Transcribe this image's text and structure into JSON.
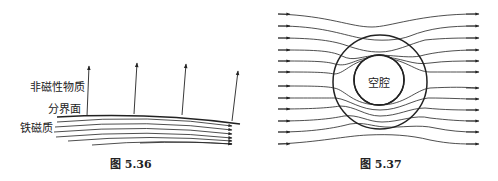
{
  "figures": [
    {
      "id": "fig-5-36",
      "caption": "图 5.36",
      "labels": {
        "nonmagnetic": "非磁性物质",
        "interface": "分界面",
        "ferromagnetic": "铁磁质"
      },
      "description": "Field lines in ferromagnetic material run nearly parallel to the interface; in the non-magnetic medium field lines leave nearly perpendicular to the interface",
      "vertical_arrows": 4,
      "horizontal_field_lines": 6
    },
    {
      "id": "fig-5-37",
      "caption": "图 5.37",
      "labels": {
        "cavity": "空腔"
      },
      "description": "Uniform field lines enter from the left, are concentrated into a ferromagnetic spherical shell and bypass the inner cavity, exiting to the right",
      "field_lines": 12
    }
  ],
  "colors": {
    "ink": "#222222",
    "background": "#ffffff"
  }
}
